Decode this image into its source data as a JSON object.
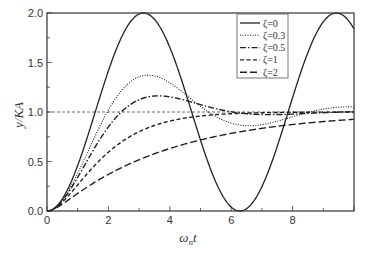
{
  "chart_data": {
    "type": "line",
    "title": "",
    "xlabel": "ω_n t",
    "ylabel": "y/KA",
    "xlim": [
      0,
      10
    ],
    "ylim": [
      0,
      2.0
    ],
    "xticks": [
      "0",
      "2",
      "4",
      "6",
      "8"
    ],
    "yticks": [
      "0.0",
      "0.5",
      "1.0",
      "1.5",
      "2.0"
    ],
    "reference_line": {
      "y": 1.0,
      "style": "dashed"
    },
    "legend_position": "upper right",
    "series": [
      {
        "name": "ζ=0",
        "zeta": 0,
        "style": "solid",
        "peak": 2.0,
        "peak_x": 3.14
      },
      {
        "name": "ζ=0.3",
        "zeta": 0.3,
        "style": "dotted",
        "peak": 1.37,
        "peak_x": 3.3
      },
      {
        "name": "ζ=0.5",
        "zeta": 0.5,
        "style": "dash-dot",
        "peak": 1.16,
        "peak_x": 3.6
      },
      {
        "name": "ζ=1",
        "zeta": 1,
        "style": "dashed",
        "value_at_10": 1.0
      },
      {
        "name": "ζ=2",
        "zeta": 2,
        "style": "long-dash",
        "value_at_10": 0.93
      }
    ]
  },
  "labels": {
    "xlabel_main": "ω",
    "xlabel_sub": "n",
    "xlabel_tail": "t",
    "ylabel": "y/KA"
  }
}
